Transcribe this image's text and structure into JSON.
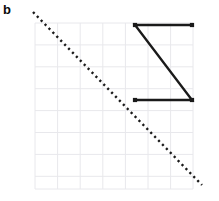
{
  "figure": {
    "panel_label": "b",
    "width": 219,
    "height": 201,
    "background_color": "#ffffff"
  },
  "grid": {
    "line_color": "#e8e8ec",
    "line_width": 1,
    "x_start": 35,
    "x_end": 193,
    "y_start": 23,
    "y_end": 189,
    "x_step": 22.6,
    "y_step": 21.9,
    "x_lines": [
      35,
      57.6,
      80.2,
      102.8,
      125.4,
      148,
      170.6,
      193
    ],
    "y_lines": [
      23,
      44.9,
      66.8,
      88.7,
      110.6,
      132.5,
      154.4,
      176.3,
      189
    ]
  },
  "chart_data": {
    "type": "line",
    "title": "",
    "xlabel": "",
    "ylabel": "",
    "grid": true,
    "legend": "none",
    "xlim": [
      35,
      193
    ],
    "ylim": [
      23,
      189
    ],
    "series": [
      {
        "name": "dotted-diagonal",
        "style": "dotted",
        "color": "#1a1a1a",
        "line_width": 2.4,
        "dash_pattern": "2.2 3.4",
        "markers": "none",
        "points": [
          {
            "x": 33,
            "y": 12
          },
          {
            "x": 202,
            "y": 185
          }
        ]
      },
      {
        "name": "z-polyline",
        "style": "solid",
        "color": "#1a1a1a",
        "line_width": 2.4,
        "markers": "square",
        "marker_size": 4.2,
        "points": [
          {
            "x": 192,
            "y": 25
          },
          {
            "x": 135,
            "y": 25
          },
          {
            "x": 192,
            "y": 100
          },
          {
            "x": 135,
            "y": 100
          }
        ]
      }
    ]
  }
}
